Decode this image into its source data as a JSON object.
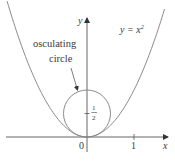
{
  "diagram": {
    "curve": {
      "equation_label_left": "y = x",
      "equation_exponent": "2",
      "function": "x^2",
      "x_range": [
        -1.7,
        1.65
      ],
      "color": "#8a8a8a"
    },
    "circle": {
      "label_line1": "osculating",
      "label_line2": "circle",
      "center": [
        0,
        0.5
      ],
      "radius": 0.5,
      "center_tick_label_num": "1",
      "center_tick_label_den": "2",
      "color": "#8a8a8a"
    },
    "axes": {
      "x_label": "x",
      "y_label": "y",
      "origin_label": "0",
      "x_tick_label": "1",
      "x_tick_value": 1,
      "color": "#555555"
    }
  }
}
